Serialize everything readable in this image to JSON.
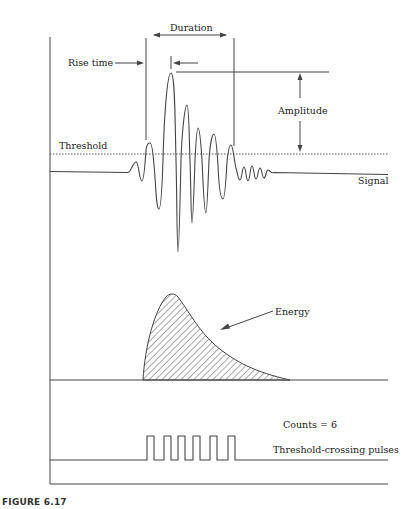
{
  "figure": {
    "caption": "FIGURE 6.17",
    "panels": {
      "signal": {
        "labels": {
          "duration": "Duration",
          "rise_time": "Rise time",
          "amplitude": "Amplitude",
          "threshold": "Threshold",
          "signal": "Signal"
        }
      },
      "energy": {
        "label": "Energy"
      },
      "pulses": {
        "counts_label": "Counts = 6",
        "label": "Threshold-crossing pulses",
        "count": 6
      }
    }
  }
}
